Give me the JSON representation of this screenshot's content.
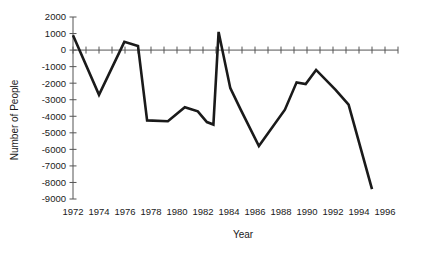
{
  "chart_data": {
    "type": "line",
    "title": "",
    "xlabel": "Year",
    "ylabel": "Number of People",
    "xlim": [
      1972,
      1997
    ],
    "ylim": [
      -9000,
      2000
    ],
    "grid": false,
    "legend": "none",
    "x_tick_labels": [
      "1972",
      "1974",
      "1976",
      "1978",
      "1980",
      "1982",
      "1984",
      "1986",
      "1988",
      "1990",
      "1992",
      "1994",
      "1996"
    ],
    "x_tick_values": [
      1972,
      1974,
      1976,
      1978,
      1980,
      1982,
      1984,
      1986,
      1988,
      1990,
      1992,
      1994,
      1996
    ],
    "x_minor_tick_interval": 1,
    "y_tick_labels": [
      "2000",
      "1000",
      "0",
      "-1000",
      "-2000",
      "-3000",
      "-4000",
      "-5000",
      "-6000",
      "-7000",
      "-8000",
      "-9000"
    ],
    "y_tick_values": [
      2000,
      1000,
      0,
      -1000,
      -2000,
      -3000,
      -4000,
      -5000,
      -6000,
      -7000,
      -8000,
      -9000
    ],
    "series": [
      {
        "name": "Number of People",
        "color": "#1a1a1a",
        "x": [
          1972,
          1973,
          1974,
          1975,
          1976,
          1977,
          1978,
          1979,
          1980,
          1981,
          1982,
          1983,
          1984,
          1985,
          1986,
          1987,
          1988,
          1989,
          1990,
          1991,
          1992,
          1993,
          1994,
          1995
        ],
        "values": [
          900,
          -900,
          -2700,
          -1100,
          500,
          300,
          -4250,
          -4300,
          -3900,
          -3450,
          -3700,
          -4350,
          -4450,
          1100,
          -2300,
          -3600,
          -5800,
          -4100,
          -2400,
          -1700,
          -1950,
          -1200,
          -2100,
          -3300
        ]
      }
    ],
    "points": [
      {
        "year": 1972,
        "value": 900
      },
      {
        "year": 1974,
        "value": -2700
      },
      {
        "year": 1976,
        "value": 500
      },
      {
        "year": 1977,
        "value": 300
      },
      {
        "year": 1978,
        "value": -4250
      },
      {
        "year": 1979,
        "value": -4300
      },
      {
        "year": 1980,
        "value": -3900
      },
      {
        "year": 1981,
        "value": -3450
      },
      {
        "year": 1982,
        "value": -3700
      },
      {
        "year": 1983,
        "value": 1100
      },
      {
        "year": 1984,
        "value": -2300
      },
      {
        "year": 1985,
        "value": -3600
      },
      {
        "year": 1986,
        "value": -5800
      },
      {
        "year": 1988,
        "value": -4100
      },
      {
        "year": 1990,
        "value": -1700
      },
      {
        "year": 1991,
        "value": -1200
      },
      {
        "year": 1993,
        "value": -2600
      },
      {
        "year": 1995,
        "value": -8400
      }
    ],
    "path": [
      {
        "year": 1972,
        "value": 900
      },
      {
        "year": 1974,
        "value": -2700
      },
      {
        "year": 1975.95,
        "value": 500
      },
      {
        "year": 1977,
        "value": 250
      },
      {
        "year": 1977.7,
        "value": -4250
      },
      {
        "year": 1979.3,
        "value": -4300
      },
      {
        "year": 1980.6,
        "value": -3450
      },
      {
        "year": 1981.6,
        "value": -3700
      },
      {
        "year": 1982.3,
        "value": -4350
      },
      {
        "year": 1982.8,
        "value": -4500
      },
      {
        "year": 1983.2,
        "value": 1100
      },
      {
        "year": 1984.1,
        "value": -2300
      },
      {
        "year": 1984.9,
        "value": -3600
      },
      {
        "year": 1986.3,
        "value": -5800
      },
      {
        "year": 1988.3,
        "value": -3600
      },
      {
        "year": 1989.2,
        "value": -1950
      },
      {
        "year": 1989.9,
        "value": -2050
      },
      {
        "year": 1990.7,
        "value": -1200
      },
      {
        "year": 1992.2,
        "value": -2400
      },
      {
        "year": 1993.2,
        "value": -3300
      },
      {
        "year": 1995.0,
        "value": -8400
      }
    ]
  }
}
